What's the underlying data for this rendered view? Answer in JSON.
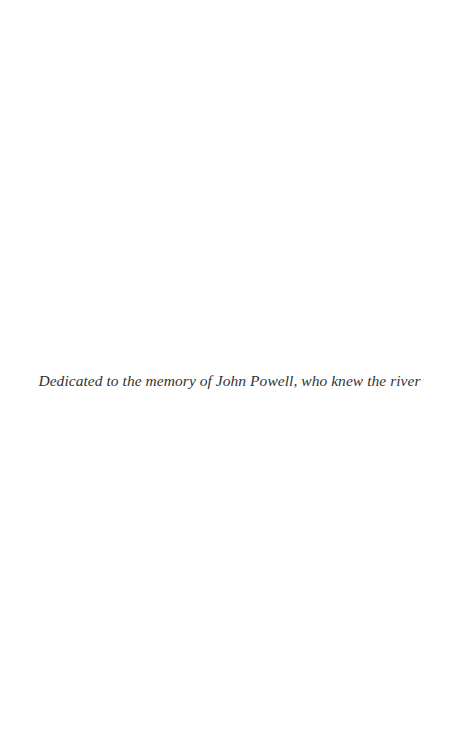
{
  "page": {
    "background": "#ffffff",
    "dedication": {
      "text": "Dedicated to the memory of John Powell, who knew the river",
      "color": "#333333"
    }
  }
}
